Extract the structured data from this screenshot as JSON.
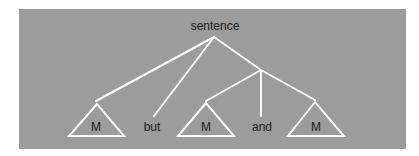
{
  "diagram": {
    "type": "tree",
    "background_color": "#9c9c9c",
    "line_color": "#ffffff",
    "root": {
      "label": "sentence"
    },
    "leaves": [
      {
        "label": "M",
        "kind": "triangle"
      },
      {
        "label": "but",
        "kind": "word"
      },
      {
        "label": "M",
        "kind": "triangle"
      },
      {
        "label": "and",
        "kind": "word"
      },
      {
        "label": "M",
        "kind": "triangle"
      }
    ]
  }
}
